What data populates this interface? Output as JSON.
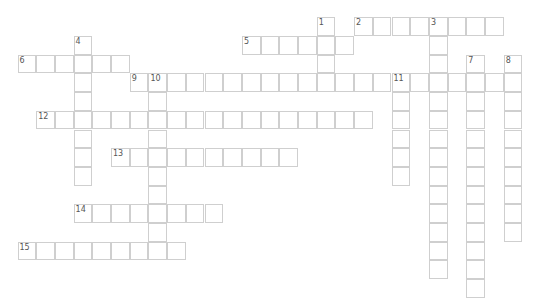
{
  "puzzle": {
    "cell_size": 18.7,
    "origin_x": 17.5,
    "origin_y": 17.3,
    "border_color": "#cfcfcf",
    "words": [
      {
        "number": "1",
        "direction": "down",
        "row": 0,
        "col": 16,
        "length": 4
      },
      {
        "number": "2",
        "direction": "across",
        "row": 0,
        "col": 18,
        "length": 8
      },
      {
        "number": "3",
        "direction": "down",
        "row": 0,
        "col": 22,
        "length": 14
      },
      {
        "number": "4",
        "direction": "down",
        "row": 1,
        "col": 3,
        "length": 8
      },
      {
        "number": "5",
        "direction": "across",
        "row": 1,
        "col": 12,
        "length": 6
      },
      {
        "number": "6",
        "direction": "across",
        "row": 2,
        "col": 0,
        "length": 6
      },
      {
        "number": "7",
        "direction": "down",
        "row": 2,
        "col": 24,
        "length": 13
      },
      {
        "number": "8",
        "direction": "down",
        "row": 2,
        "col": 26,
        "length": 10
      },
      {
        "number": "9",
        "direction": "across",
        "row": 3,
        "col": 6,
        "length": 21
      },
      {
        "number": "10",
        "direction": "down",
        "row": 3,
        "col": 7,
        "length": 10
      },
      {
        "number": "11",
        "direction": "down",
        "row": 3,
        "col": 20,
        "length": 6
      },
      {
        "number": "12",
        "direction": "across",
        "row": 5,
        "col": 1,
        "length": 18
      },
      {
        "number": "13",
        "direction": "across",
        "row": 7,
        "col": 5,
        "length": 10
      },
      {
        "number": "14",
        "direction": "across",
        "row": 10,
        "col": 3,
        "length": 8
      },
      {
        "number": "15",
        "direction": "across",
        "row": 12,
        "col": 0,
        "length": 9
      }
    ]
  }
}
